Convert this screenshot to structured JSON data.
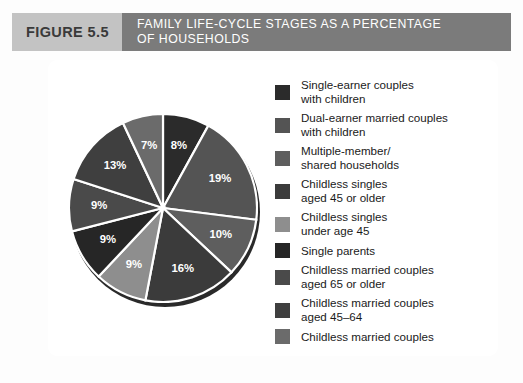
{
  "header": {
    "figure_label": "FIGURE 5.5",
    "title_lines": [
      "FAMILY LIFE-CYCLE STAGES AS A PERCENTAGE",
      "OF HOUSEHOLDS"
    ],
    "label_bg": "#c3c3c3",
    "title_bg": "#7b7b7b",
    "title_color": "#ffffff"
  },
  "chart_data": {
    "type": "pie",
    "title": "FAMILY LIFE-CYCLE STAGES AS A PERCENTAGE OF HOUSEHOLDS",
    "unit": "%",
    "start_angle_deg": 0,
    "direction": "clockwise",
    "legend_position": "right",
    "categories": [
      "Single-earner couples with children",
      "Dual-earner married couples with children",
      "Multiple-member/shared households",
      "Childless singles aged 45 or older",
      "Childless singles under age 45",
      "Single parents",
      "Childless married couples aged 65 or older",
      "Childless married couples aged 45-64",
      "Childless married couples"
    ],
    "values": [
      8,
      19,
      10,
      16,
      9,
      9,
      9,
      13,
      7
    ],
    "labels": [
      "8%",
      "19%",
      "10%",
      "16%",
      "9%",
      "9%",
      "9%",
      "13%",
      "7%"
    ],
    "colors": [
      "#2b2b2b",
      "#545454",
      "#5e5e5e",
      "#3b3b3b",
      "#8e8e8e",
      "#262626",
      "#4a4a4a",
      "#3f3f3f",
      "#6b6b6b"
    ]
  },
  "legend": {
    "items": [
      {
        "swatch": "#2b2b2b",
        "lines": [
          "Single-earner couples",
          "with children"
        ],
        "value_label": "8%"
      },
      {
        "swatch": "#545454",
        "lines": [
          "Dual-earner married couples",
          "with children"
        ],
        "value_label": "19%"
      },
      {
        "swatch": "#5e5e5e",
        "lines": [
          "Multiple-member/",
          "shared households"
        ],
        "value_label": "10%"
      },
      {
        "swatch": "#3b3b3b",
        "lines": [
          "Childless singles",
          "aged 45 or older"
        ],
        "value_label": "16%"
      },
      {
        "swatch": "#8e8e8e",
        "lines": [
          "Childless singles",
          "under age 45"
        ],
        "value_label": "9%"
      },
      {
        "swatch": "#262626",
        "lines": [
          "Single parents"
        ],
        "value_label": "9%"
      },
      {
        "swatch": "#4a4a4a",
        "lines": [
          "Childless married couples",
          "aged 65 or older"
        ],
        "value_label": "9%"
      },
      {
        "swatch": "#3f3f3f",
        "lines": [
          "Childless married couples",
          "aged 45–64"
        ],
        "value_label": "13%"
      },
      {
        "swatch": "#6b6b6b",
        "lines": [
          "Childless married couples"
        ],
        "value_label": "7%"
      }
    ]
  }
}
